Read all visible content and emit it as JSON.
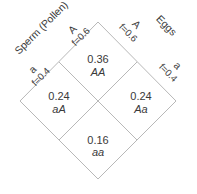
{
  "diagram": {
    "axes": {
      "sperm": "Sperm (Pollen)",
      "eggs": "Eggs"
    },
    "sperm_alleles": [
      {
        "allele": "A",
        "freq": "f=0.6"
      },
      {
        "allele": "a",
        "freq": "f=0.4"
      }
    ],
    "egg_alleles": [
      {
        "allele": "A",
        "freq": "f=0.6"
      },
      {
        "allele": "a",
        "freq": "f=0.4"
      }
    ],
    "cells": [
      {
        "value": "0.36",
        "genotype": "AA"
      },
      {
        "value": "0.24",
        "genotype": "aA"
      },
      {
        "value": "0.24",
        "genotype": "Aa"
      },
      {
        "value": "0.16",
        "genotype": "aa"
      }
    ],
    "colors": {
      "grid": "#b8b8b8",
      "text": "#3a3a3a"
    }
  }
}
